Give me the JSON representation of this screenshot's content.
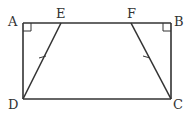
{
  "diagram": {
    "type": "geometry",
    "shape": "rectangle ABCD with inner trapezoid EFCD",
    "points": {
      "A": {
        "label": "A",
        "x": 23,
        "y": 23,
        "lx": 8,
        "ly": 26
      },
      "E": {
        "label": "E",
        "x": 61,
        "y": 23,
        "lx": 56,
        "ly": 18
      },
      "F": {
        "label": "F",
        "x": 131,
        "y": 23,
        "lx": 127,
        "ly": 18
      },
      "B": {
        "label": "B",
        "x": 171,
        "y": 23,
        "lx": 174,
        "ly": 26
      },
      "D": {
        "label": "D",
        "x": 23,
        "y": 99,
        "lx": 8,
        "ly": 109
      },
      "C": {
        "label": "C",
        "x": 171,
        "y": 99,
        "lx": 173,
        "ly": 109
      }
    },
    "segments": [
      "AB",
      "BC",
      "CD",
      "DA",
      "DE",
      "CF"
    ],
    "right_angles": [
      "A",
      "B"
    ],
    "equal_marks": [
      "DE",
      "CF"
    ],
    "stroke_color": "#333333"
  }
}
